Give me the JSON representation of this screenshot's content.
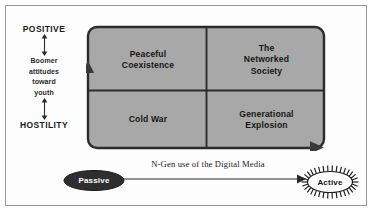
{
  "y_axis": {
    "top_label": "POSITIVE",
    "bottom_label": "HOSTILITY",
    "description_lines": [
      "Boomer",
      "attitudes",
      "toward",
      "youth"
    ]
  },
  "x_axis": {
    "label": "N-Gen use of the Digital Media",
    "left_node": "Passive",
    "right_node": "Active"
  },
  "quadrants": [
    {
      "id": "top-left",
      "label": "Peaceful Coexistence",
      "lines": [
        "Peaceful",
        "Coexistence"
      ]
    },
    {
      "id": "top-right",
      "label": "The Networked Society",
      "lines": [
        "The",
        "Networked",
        "Society"
      ]
    },
    {
      "id": "bottom-left",
      "label": "Cold War",
      "lines": [
        "Cold War"
      ]
    },
    {
      "id": "bottom-right",
      "label": "Generational Explosion",
      "lines": [
        "Generational",
        "Explosion"
      ]
    }
  ],
  "colors": {
    "quadrant_fill": "#a8a8a8",
    "quadrant_stroke": "#2b2b2b",
    "passive_fill": "#2e2e2e",
    "active_fill": "#ffffff",
    "frame": "#9a9a9a",
    "text": "#161616"
  }
}
